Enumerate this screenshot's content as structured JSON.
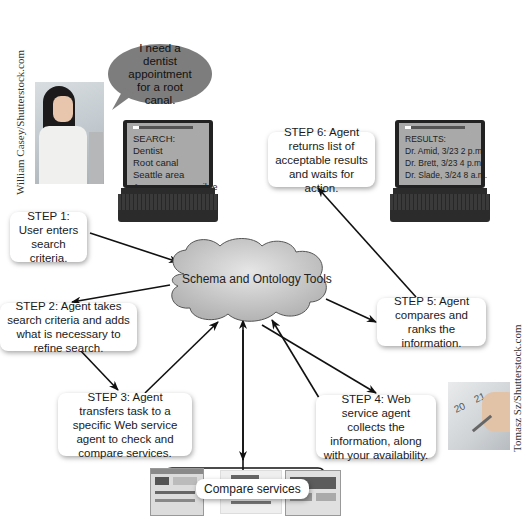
{
  "credits": {
    "left": "William Casey/Shutterstock.com",
    "right": "Tomasz Sz/Shutterstock.com"
  },
  "speech_bubble": {
    "text": "I need a dentist appointment for a root canal."
  },
  "search_laptop": {
    "lines": [
      "SEARCH:",
      "Dentist",
      "Root canal",
      "Seattle area",
      "As soon as possible"
    ]
  },
  "results_laptop": {
    "lines": [
      "RESULTS:",
      "Dr. Amid, 3/23 2 p.m.",
      "Dr. Brett, 3/23 4 p.m.",
      "Dr. Slade, 3/24 8 a.m."
    ]
  },
  "cloud": {
    "label": "Schema and Ontology Tools",
    "fill_color": "#c9c9c9"
  },
  "steps": [
    {
      "id": 1,
      "text": "STEP 1: User enters search criteria."
    },
    {
      "id": 2,
      "text": "STEP 2: Agent takes search criteria and adds what is necessary to refine search."
    },
    {
      "id": 3,
      "text": "STEP 3: Agent transfers task to a specific Web service agent to check and compare services."
    },
    {
      "id": 4,
      "text": "STEP 4: Web service agent collects the information, along with your availability."
    },
    {
      "id": 5,
      "text": "STEP 5: Agent compares and ranks the information."
    },
    {
      "id": 6,
      "text": "STEP 6: Agent returns list of acceptable results and waits for action."
    }
  ],
  "compare": {
    "label": "Compare services"
  },
  "calendar_photo": {
    "dates": [
      "20",
      "21"
    ]
  }
}
